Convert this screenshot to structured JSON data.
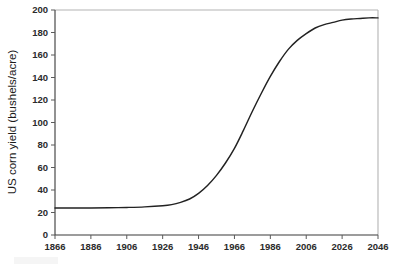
{
  "chart_data": {
    "type": "line",
    "title": "",
    "subtitle": "",
    "xlabel": "",
    "ylabel": "US corn yield (bushels/acre)",
    "xlim": [
      1866,
      2046
    ],
    "ylim": [
      0,
      200
    ],
    "grid": false,
    "legend": null,
    "x_tick_labels": [
      "1866",
      "1886",
      "1906",
      "1926",
      "1946",
      "1966",
      "1986",
      "2006",
      "2026",
      "2046"
    ],
    "x_ticks": [
      1866,
      1886,
      1906,
      1926,
      1946,
      1966,
      1986,
      2006,
      2026,
      2046
    ],
    "y_tick_labels": [
      "0",
      "20",
      "40",
      "60",
      "80",
      "100",
      "120",
      "140",
      "160",
      "180",
      "200"
    ],
    "y_ticks": [
      0,
      20,
      40,
      60,
      80,
      100,
      120,
      140,
      160,
      180,
      200
    ],
    "series": [
      {
        "name": "US corn yield",
        "color": "#222222",
        "x": [
          1866,
          1876,
          1886,
          1896,
          1906,
          1916,
          1926,
          1931,
          1936,
          1941,
          1946,
          1951,
          1956,
          1961,
          1966,
          1971,
          1976,
          1981,
          1986,
          1991,
          1996,
          2001,
          2006,
          2011,
          2016,
          2021,
          2026,
          2031,
          2036,
          2041,
          2046
        ],
        "values": [
          24,
          24,
          24,
          24.2,
          24.5,
          25,
          26,
          27,
          29,
          32,
          37,
          44,
          53,
          64,
          77,
          93,
          110,
          126,
          141,
          154,
          165,
          173,
          179,
          184,
          187,
          189,
          191,
          192,
          192.5,
          193,
          193
        ]
      }
    ],
    "annotations": []
  },
  "axes": {
    "y_axis_title": "US corn yield (bushels/acre)"
  },
  "colors": {
    "curve": "#222222",
    "axis": "#3a3a3a",
    "frame": "#b4b4b4",
    "tick_text": "#2b2b2b",
    "background": "#ffffff"
  }
}
